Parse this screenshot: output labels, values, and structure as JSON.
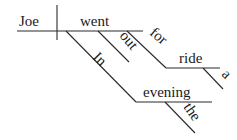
{
  "diagram": {
    "type": "sentence-diagram",
    "sentence": "Joe went out for a ride in the evening",
    "subject": "Joe",
    "verb": "went",
    "modifiers": {
      "out": "out",
      "for": "for",
      "ride": "ride",
      "a": "a",
      "in": "In",
      "evening": "evening",
      "the": "the"
    },
    "colors": {
      "ink": "#1a1a1a",
      "background": "#ffffff"
    }
  }
}
